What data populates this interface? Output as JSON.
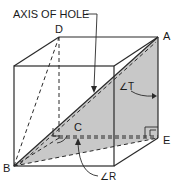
{
  "diagram": {
    "callout": "AXIS OF HOLE",
    "vertices": {
      "A": "A",
      "B": "B",
      "C": "C",
      "D": "D",
      "E": "E"
    },
    "angles": {
      "T": "∠T",
      "R": "∠R"
    },
    "colors": {
      "shaded_plane": "#c8c8c8",
      "lines": "#2a2a2a",
      "background": "#ffffff"
    }
  }
}
